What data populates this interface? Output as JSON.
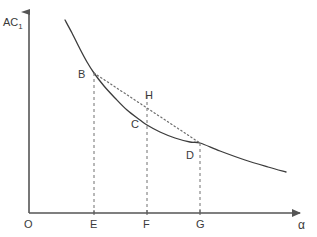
{
  "chart_data": {
    "type": "line",
    "title": "",
    "subtitle": "",
    "ylabel": "AC",
    "ylabel_subscript": "1",
    "xlabel": "α",
    "origin_label": "O",
    "grid": false,
    "legend_position": "none",
    "xlim": [
      0,
      1
    ],
    "ylim": [
      0,
      1
    ],
    "axis_color": "#555555",
    "curve_color": "#3c3c3c",
    "chord_color": "#6e6e6e",
    "dash_color": "#707070",
    "text_color": "#3a3a3a",
    "axes": {
      "y_axis": {
        "x": 29,
        "y_top": 8,
        "y_bottom": 213
      },
      "x_axis": {
        "y": 213,
        "x_left": 29,
        "x_right": 305
      }
    },
    "curve": {
      "name": "AC1",
      "style": "solid",
      "points": [
        {
          "x": 65,
          "y": 20
        },
        {
          "x": 72,
          "y": 33
        },
        {
          "x": 80,
          "y": 49
        },
        {
          "x": 87,
          "y": 62
        },
        {
          "x": 94,
          "y": 73
        },
        {
          "x": 104,
          "y": 86
        },
        {
          "x": 115,
          "y": 98
        },
        {
          "x": 127,
          "y": 110
        },
        {
          "x": 140,
          "y": 120
        },
        {
          "x": 147,
          "y": 125
        },
        {
          "x": 160,
          "y": 132
        },
        {
          "x": 175,
          "y": 138
        },
        {
          "x": 190,
          "y": 142
        },
        {
          "x": 200,
          "y": 143
        },
        {
          "x": 220,
          "y": 151
        },
        {
          "x": 245,
          "y": 160
        },
        {
          "x": 268,
          "y": 167
        },
        {
          "x": 286,
          "y": 172
        }
      ]
    },
    "chord": {
      "name": "BD-chord",
      "style": "dotted",
      "from": {
        "label": "B",
        "x": 94,
        "y": 73
      },
      "to": {
        "label": "D",
        "x": 200,
        "y": 143
      }
    },
    "drop_lines": [
      {
        "name": "E",
        "x": 94,
        "y_top": 73,
        "y_bottom": 213,
        "style": "dashed"
      },
      {
        "name": "F",
        "x": 147,
        "y_top": 96,
        "y_bottom": 213,
        "style": "dashed"
      },
      {
        "name": "G",
        "x": 200,
        "y_top": 143,
        "y_bottom": 213,
        "style": "dashed"
      }
    ],
    "points": [
      {
        "label": "B",
        "x": 94,
        "y": 73,
        "label_x": 78,
        "label_y": 69,
        "on": "curve"
      },
      {
        "label": "H",
        "x": 147,
        "y": 108,
        "label_x": 145,
        "label_y": 90,
        "on": "chord"
      },
      {
        "label": "C",
        "x": 147,
        "y": 125,
        "label_x": 131,
        "label_y": 119,
        "on": "curve"
      },
      {
        "label": "D",
        "x": 200,
        "y": 143,
        "label_x": 186,
        "label_y": 150,
        "on": "curve"
      }
    ],
    "x_ticks": [
      {
        "label": "E",
        "x": 94,
        "label_x": 90,
        "label_y": 219
      },
      {
        "label": "F",
        "x": 147,
        "label_x": 143,
        "label_y": 219
      },
      {
        "label": "G",
        "x": 200,
        "label_x": 196,
        "label_y": 219
      }
    ],
    "labels": {
      "y_axis_label_x": 3,
      "y_axis_label_y": 17,
      "x_axis_label_x": 298,
      "x_axis_label_y": 219,
      "origin_x": 24,
      "origin_y": 219
    }
  }
}
